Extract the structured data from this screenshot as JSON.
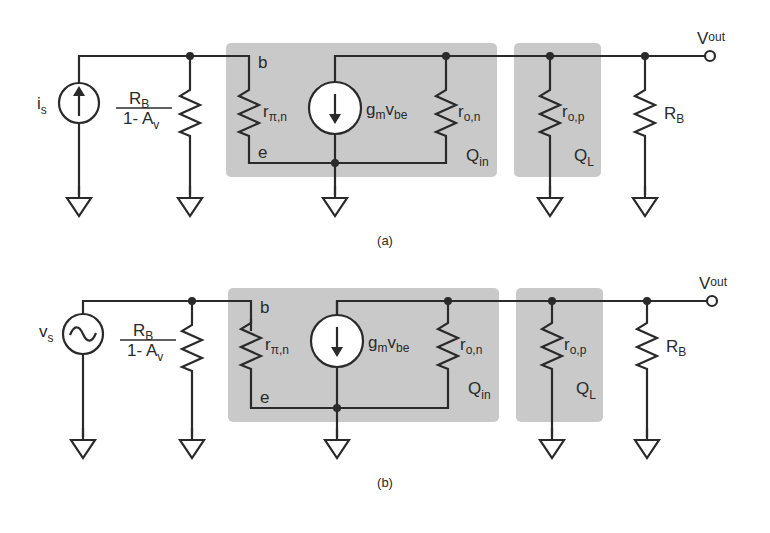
{
  "figure": {
    "panels": [
      {
        "caption": "(a)",
        "source": {
          "type": "current-source",
          "symbol": "i",
          "sub": "s"
        },
        "bias_resistor": {
          "num": "R",
          "num_sub": "B",
          "den": "1- A",
          "den_sub": "v"
        },
        "q_in": {
          "label": "Q",
          "label_sub": "in",
          "base_node": "b",
          "emitter_node": "e",
          "r_pi": {
            "symbol": "r",
            "sub": "π,n"
          },
          "gm_source": {
            "g": "g",
            "g_sub": "m",
            "v": "v",
            "v_sub": "be"
          },
          "r_o": {
            "symbol": "r",
            "sub": "o,n"
          }
        },
        "q_l": {
          "label": "Q",
          "label_sub": "L",
          "r_o": {
            "symbol": "r",
            "sub": "o,p"
          }
        },
        "load_resistor": {
          "symbol": "R",
          "sub": "B"
        },
        "output": {
          "symbol": "V",
          "sub": "out"
        }
      },
      {
        "caption": "(b)",
        "source": {
          "type": "voltage-source",
          "symbol": "v",
          "sub": "s"
        },
        "bias_resistor": {
          "num": "R",
          "num_sub": "B",
          "den": "1- A",
          "den_sub": "v"
        },
        "q_in": {
          "label": "Q",
          "label_sub": "in",
          "base_node": "b",
          "emitter_node": "e",
          "r_pi": {
            "symbol": "r",
            "sub": "π,n"
          },
          "gm_source": {
            "g": "g",
            "g_sub": "m",
            "v": "v",
            "v_sub": "be"
          },
          "r_o": {
            "symbol": "r",
            "sub": "o,n"
          }
        },
        "q_l": {
          "label": "Q",
          "label_sub": "L",
          "r_o": {
            "symbol": "r",
            "sub": "o,p"
          }
        },
        "load_resistor": {
          "symbol": "R",
          "sub": "B"
        },
        "output": {
          "symbol": "V",
          "sub": "out"
        }
      }
    ]
  }
}
